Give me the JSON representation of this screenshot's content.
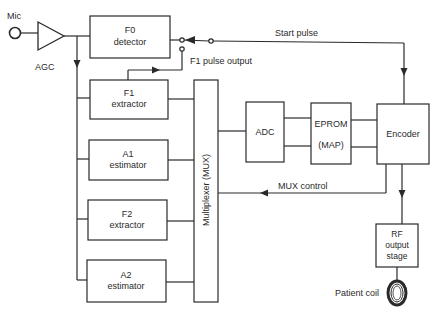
{
  "diagram": {
    "input": {
      "mic_label": "Mic",
      "agc_label": "AGC"
    },
    "blocks": {
      "f0_detector": {
        "line1": "F0",
        "line2": "detector"
      },
      "f1_extractor": {
        "line1": "F1",
        "line2": "extractor"
      },
      "a1_estimator": {
        "line1": "A1",
        "line2": "estimator"
      },
      "f2_extractor": {
        "line1": "F2",
        "line2": "extractor"
      },
      "a2_estimator": {
        "line1": "A2",
        "line2": "estimator"
      },
      "mux": {
        "label": "Multiplexer (MUX)"
      },
      "adc": {
        "label": "ADC"
      },
      "eprom": {
        "line1": "EPROM",
        "line2": "(MAP)"
      },
      "encoder": {
        "label": "Encoder"
      },
      "rf_stage": {
        "line1": "RF",
        "line2": "output",
        "line3": "stage"
      }
    },
    "signals": {
      "start_pulse": "Start pulse",
      "f1_pulse_output": "F1 pulse output",
      "mux_control": "MUX control",
      "patient_coil": "Patient coil"
    },
    "colors": {
      "line": "#2a2a2a",
      "background": "#ffffff"
    }
  }
}
